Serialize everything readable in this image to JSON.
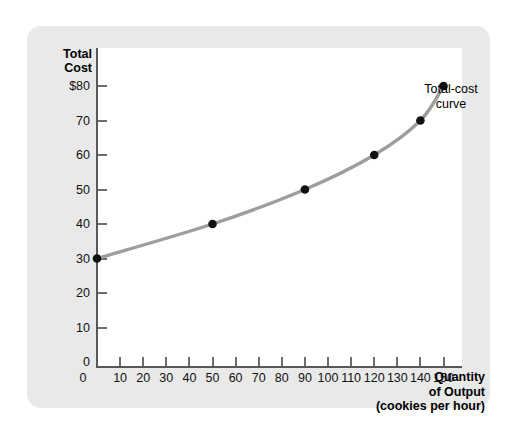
{
  "figure": {
    "card_color": "#e9e9e9",
    "plot_background": "#ffffff",
    "axis_color": "#58585a",
    "curve_color": "#9d9d9d",
    "point_color": "#111111"
  },
  "y_axis": {
    "title_line1": "Total",
    "title_line2": "Cost",
    "tick_labels": [
      "$80",
      "70",
      "60",
      "50",
      "40",
      "30",
      "20",
      "10",
      "0"
    ]
  },
  "x_axis": {
    "title_line1": "Quantity",
    "title_line2": "of Output",
    "title_line3": "(cookies per hour)",
    "tick_labels": [
      "0",
      "10",
      "20",
      "30",
      "40",
      "50",
      "60",
      "70",
      "80",
      "90",
      "100",
      "110",
      "120",
      "130",
      "140",
      "150"
    ]
  },
  "annotation": {
    "line1": "Total-cost",
    "line2": "curve"
  },
  "chart_data": {
    "type": "line",
    "title": "",
    "subtitle": "",
    "xlabel": "Quantity of Output (cookies per hour)",
    "ylabel": "Total Cost",
    "xlim": [
      0,
      155
    ],
    "ylim": [
      0,
      85
    ],
    "xticks": [
      0,
      10,
      20,
      30,
      40,
      50,
      60,
      70,
      80,
      90,
      100,
      110,
      120,
      130,
      140,
      150
    ],
    "yticks": [
      0,
      10,
      20,
      30,
      40,
      50,
      60,
      70,
      80
    ],
    "ytick_labels": [
      "0",
      "10",
      "20",
      "30",
      "40",
      "50",
      "60",
      "70",
      "$80"
    ],
    "grid": false,
    "legend": false,
    "annotations": [
      {
        "text": "Total-cost curve",
        "x": 150,
        "y": 80,
        "position": "right"
      }
    ],
    "series": [
      {
        "name": "Total-cost curve",
        "color": "#9d9d9d",
        "marker": "circle",
        "marker_color": "#111111",
        "x": [
          0,
          50,
          90,
          120,
          140,
          150
        ],
        "y": [
          30,
          40,
          50,
          60,
          70,
          80
        ]
      }
    ],
    "points": [
      {
        "quantity": 0,
        "total_cost": 30
      },
      {
        "quantity": 50,
        "total_cost": 40
      },
      {
        "quantity": 90,
        "total_cost": 50
      },
      {
        "quantity": 120,
        "total_cost": 60
      },
      {
        "quantity": 140,
        "total_cost": 70
      },
      {
        "quantity": 150,
        "total_cost": 80
      }
    ]
  }
}
